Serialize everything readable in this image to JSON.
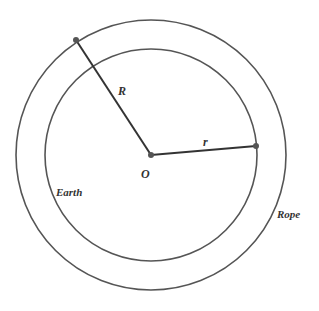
{
  "diagram": {
    "center": {
      "x": 151,
      "y": 155
    },
    "outer_radius": 135,
    "inner_radius": 106,
    "R_endpoint": {
      "x": 76,
      "y": 40
    },
    "r_endpoint": {
      "x": 256,
      "y": 146
    },
    "colors": {
      "circle": "#555555",
      "line": "#333333",
      "point": "#555555"
    }
  },
  "labels": {
    "R": "R",
    "r": "r",
    "O": "O",
    "earth": "Earth",
    "rope": "Rope"
  }
}
